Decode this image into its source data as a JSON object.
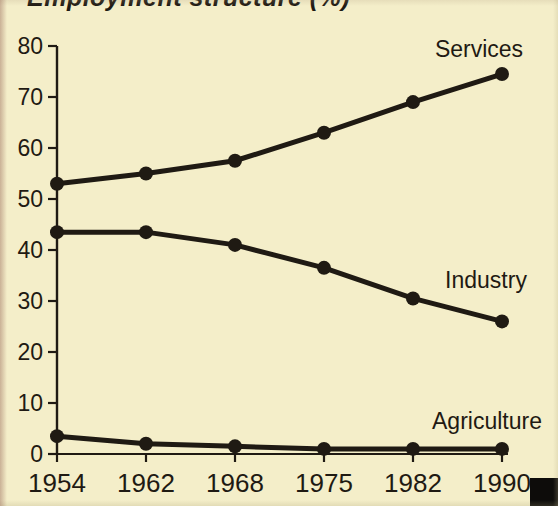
{
  "photo": {
    "background_color": "#f4eec9",
    "ink_color": "#1f1a13",
    "corner_block_color": "#0d0c0a"
  },
  "chart_data": {
    "type": "line",
    "title": "Employment structure (%)",
    "x_labels": [
      "1954",
      "1962",
      "1968",
      "1975",
      "1982",
      "1990"
    ],
    "series": [
      {
        "name": "Services",
        "values": [
          53,
          55,
          57.5,
          63,
          69,
          74.5
        ],
        "label_anchor": {
          "x": 479,
          "y": 57
        }
      },
      {
        "name": "Industry",
        "values": [
          43.5,
          43.5,
          41,
          36.5,
          30.5,
          26
        ],
        "label_anchor": {
          "x": 486,
          "y": 288
        }
      },
      {
        "name": "Agriculture",
        "values": [
          3.5,
          2,
          1.5,
          1,
          1,
          1
        ],
        "label_anchor": {
          "x": 487,
          "y": 429
        }
      }
    ],
    "ylim": [
      0,
      80
    ],
    "ytick_step": 10,
    "yticks": [
      0,
      10,
      20,
      30,
      40,
      50,
      60,
      70,
      80
    ],
    "xlabel": "",
    "ylabel": "",
    "grid": false,
    "legend": "inline-series-labels",
    "marker": "filled-circle",
    "line_color": "#1f1a13"
  }
}
